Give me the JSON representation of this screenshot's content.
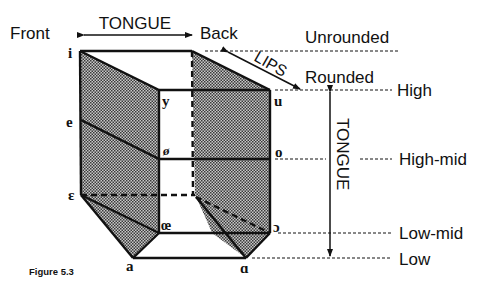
{
  "diagram": {
    "caption": "Figure 5.3",
    "axes": {
      "tongue_horizontal": {
        "label": "TONGUE",
        "left": "Front",
        "right": "Back"
      },
      "lips": {
        "label": "LIPS",
        "top": "Unrounded",
        "bottom": "Rounded"
      },
      "tongue_vertical": {
        "label": "TONGUE"
      }
    },
    "height_levels": [
      {
        "label": "High"
      },
      {
        "label": "High-mid"
      },
      {
        "label": "Low-mid"
      },
      {
        "label": "Low"
      }
    ],
    "vowels": {
      "i": "i",
      "y": "y",
      "u": "u",
      "e": "e",
      "oslash": "ø",
      "o": "o",
      "epsilon": "ɛ",
      "oe": "œ",
      "open_o": "ɔ",
      "a": "a",
      "alpha": "ɑ"
    },
    "colors": {
      "ink": "#111111",
      "shade_dark": "#555555",
      "shade_light": "#bbbbbb",
      "background": "#ffffff"
    }
  }
}
